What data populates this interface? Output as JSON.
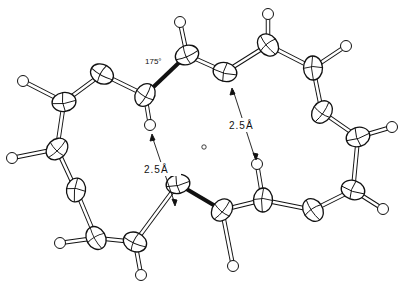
{
  "diagram": {
    "type": "ORTEP molecular structure",
    "labels": {
      "angle": "175°",
      "distance_left": "2.5Å",
      "distance_right": "2.5Å"
    },
    "carbons": [
      [
        145,
        95
      ],
      [
        187,
        55
      ],
      [
        225,
        72
      ],
      [
        268,
        45
      ],
      [
        313,
        68
      ],
      [
        322,
        112
      ],
      [
        358,
        137
      ],
      [
        353,
        190
      ],
      [
        313,
        210
      ],
      [
        263,
        200
      ],
      [
        222,
        210
      ],
      [
        178,
        184
      ],
      [
        135,
        242
      ],
      [
        96,
        238
      ],
      [
        76,
        190
      ],
      [
        57,
        149
      ],
      [
        64,
        102
      ],
      [
        102,
        74
      ]
    ],
    "hydrogens": [
      [
        150,
        125
      ],
      [
        180,
        22
      ],
      [
        268,
        14
      ],
      [
        346,
        46
      ],
      [
        392,
        127
      ],
      [
        383,
        209
      ],
      [
        257,
        164
      ],
      [
        233,
        266
      ],
      [
        141,
        275
      ],
      [
        60,
        243
      ],
      [
        12,
        158
      ],
      [
        23,
        81
      ]
    ],
    "colors": {
      "ink": "#111111",
      "bond_fill": "#ffffff"
    }
  }
}
